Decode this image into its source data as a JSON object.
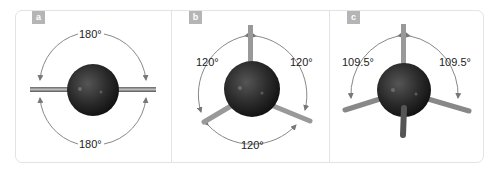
{
  "figure": {
    "panels": [
      {
        "id": "a",
        "label": "a",
        "geometry": "linear",
        "angles": [
          "180°",
          "180°"
        ]
      },
      {
        "id": "b",
        "label": "b",
        "geometry": "trigonal planar",
        "angles": [
          "120°",
          "120°",
          "120°"
        ]
      },
      {
        "id": "c",
        "label": "c",
        "geometry": "tetrahedral",
        "angles": [
          "109.5°",
          "109.5°"
        ]
      }
    ],
    "colors": {
      "badge": "#b5b5b5",
      "border": "#e3e3e3",
      "arrow": "#777777",
      "sphere": "#2a2a2a",
      "bond": "#888888"
    }
  }
}
